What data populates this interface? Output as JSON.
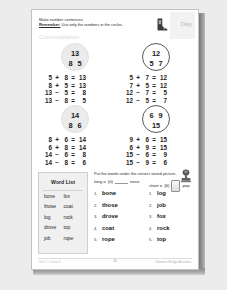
{
  "page": {
    "header": {
      "instruction_line1": "Make number sentences.",
      "remember_label": "Remember:",
      "remember_text": " Use only the numbers in the circles.",
      "watermark": "Consolidation"
    },
    "day_tab": {
      "label": "Day",
      "icon": "boot-icon"
    },
    "math": {
      "problems": [
        {
          "id": "p1",
          "circle_style": "filled",
          "whole": "13",
          "parts": [
            "8",
            "5"
          ],
          "equations": [
            {
              "a": "5",
              "op": "+",
              "b": "8",
              "eq": "=",
              "c": "13"
            },
            {
              "a": "8",
              "op": "+",
              "b": "5",
              "eq": "=",
              "c": "13"
            },
            {
              "a": "13",
              "op": "−",
              "b": "5",
              "eq": "=",
              "c": "8"
            },
            {
              "a": "13",
              "op": "−",
              "b": "8",
              "eq": "=",
              "c": "5"
            }
          ]
        },
        {
          "id": "p2",
          "circle_style": "outlined",
          "whole": "12",
          "parts": [
            "5",
            "7"
          ],
          "equations": [
            {
              "a": "5",
              "op": "+",
              "b": "7",
              "eq": "=",
              "c": "12"
            },
            {
              "a": "7",
              "op": "+",
              "b": "5",
              "eq": "=",
              "c": "12"
            },
            {
              "a": "12",
              "op": "−",
              "b": "7",
              "eq": "=",
              "c": "5"
            },
            {
              "a": "12",
              "op": "−",
              "b": "5",
              "eq": "=",
              "c": "7"
            }
          ]
        },
        {
          "id": "p3",
          "circle_style": "filled",
          "whole": "14",
          "parts": [
            "8",
            "6"
          ],
          "equations": [
            {
              "a": "8",
              "op": "+",
              "b": "6",
              "eq": "=",
              "c": "14"
            },
            {
              "a": "6",
              "op": "+",
              "b": "8",
              "eq": "=",
              "c": "14"
            },
            {
              "a": "14",
              "op": "−",
              "b": "6",
              "eq": "=",
              "c": "8"
            },
            {
              "a": "14",
              "op": "−",
              "b": "8",
              "eq": "=",
              "c": "6"
            }
          ]
        },
        {
          "id": "p4",
          "circle_style": "outlined",
          "whole": "15",
          "parts": [
            "6",
            "9"
          ],
          "equations": [
            {
              "a": "9",
              "op": "+",
              "b": "6",
              "eq": "=",
              "c": "15"
            },
            {
              "a": "6",
              "op": "+",
              "b": "9",
              "eq": "=",
              "c": "15"
            },
            {
              "a": "15",
              "op": "−",
              "b": "6",
              "eq": "=",
              "c": "9"
            },
            {
              "a": "15",
              "op": "−",
              "b": "9",
              "eq": "=",
              "c": "6"
            }
          ]
        }
      ]
    },
    "phonics": {
      "instruction": "Put the words under the correct sound-picture.",
      "word_list": {
        "title": "Word List",
        "words": [
          "bone",
          "fox",
          "those",
          "coat",
          "log",
          "rock",
          "drove",
          "top",
          "job",
          "rope"
        ]
      },
      "columns": [
        {
          "id": "long-o",
          "heading_prefix": "long o",
          "heading_symbol": "(ō)",
          "heading_suffix": "nose",
          "answers": [
            "bone",
            "those",
            "drove",
            "coat",
            "rope"
          ],
          "numbers": [
            "1.",
            "2.",
            "3.",
            "4.",
            "5."
          ]
        },
        {
          "id": "short-o",
          "heading_prefix": "short o",
          "heading_symbol": "(ŏ)",
          "heading_suffix": "pop",
          "answers": [
            "log",
            "job",
            "fox",
            "rock",
            "top"
          ],
          "numbers": [
            "1.",
            "2.",
            "3.",
            "4.",
            "5."
          ]
        }
      ],
      "icon": "stamp-icon"
    },
    "footer": {
      "left": "Unit 5 · Lesson 3",
      "center": "35",
      "right": "Summer Bridge Activities"
    }
  }
}
